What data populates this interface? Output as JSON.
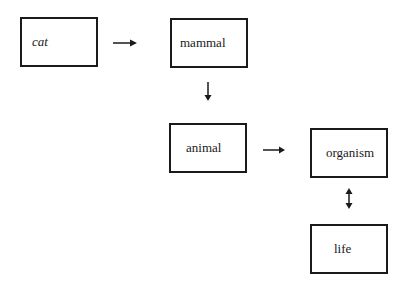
{
  "diagram": {
    "nodes": [
      {
        "id": "cat",
        "label": "cat",
        "italic": true
      },
      {
        "id": "mammal",
        "label": "mammal",
        "italic": false
      },
      {
        "id": "animal",
        "label": "animal",
        "italic": false
      },
      {
        "id": "organism",
        "label": "organism",
        "italic": false
      },
      {
        "id": "life",
        "label": "life",
        "italic": false
      }
    ],
    "edges": [
      {
        "from": "cat",
        "to": "mammal",
        "type": "right-arrow"
      },
      {
        "from": "mammal",
        "to": "animal",
        "type": "down-arrow"
      },
      {
        "from": "animal",
        "to": "organism",
        "type": "right-arrow"
      },
      {
        "from": "organism",
        "to": "life",
        "type": "bidirectional-vertical-arrow"
      }
    ],
    "colors": {
      "stroke": "#1a1a1a",
      "background": "#ffffff"
    }
  }
}
